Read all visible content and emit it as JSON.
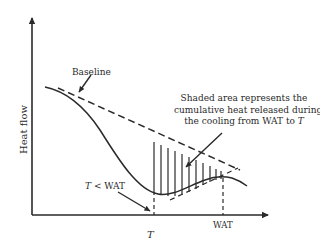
{
  "figure": {
    "type": "DSC cooling thermogram schematic",
    "y_axis_label": "Heat flow",
    "x_axis_label": "T",
    "labels": {
      "baseline": "Baseline",
      "annotation_line1": "Shaded area represents the",
      "annotation_line2": "cumulative heat released during",
      "annotation_line3_prefix": "the cooling from WAT to ",
      "annotation_line3_italic": "T",
      "t_less_wat_italic": "T",
      "t_less_wat_rest": " < WAT",
      "x_tick_t": "T",
      "x_tick_wat": "WAT"
    },
    "colors": {
      "line": "#2a2a2a",
      "background": "#ffffff"
    }
  }
}
